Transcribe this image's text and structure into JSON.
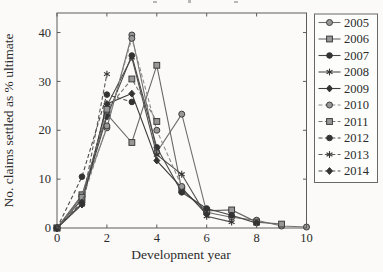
{
  "figure": {
    "xlabel": "Development year",
    "ylabel": "No. claims settled as % ultimate"
  },
  "colors": {
    "ink": "#2b2b2b",
    "paper": "#fbfaf8",
    "axis_frame": "#5c5c5c",
    "legend_border": "#686868",
    "marker_light_fill": "#989898",
    "marker_dark_fill": "#333333",
    "marker_stroke": "#3c3c3c"
  },
  "chart_data": {
    "type": "line",
    "title": "",
    "xlabel": "Development year",
    "ylabel": "No. claims settled as % ultimate",
    "xlim": [
      0,
      10
    ],
    "ylim": [
      0,
      44
    ],
    "x_ticks": [
      0,
      2,
      4,
      6,
      8,
      10
    ],
    "y_ticks": [
      0,
      10,
      20,
      30,
      40
    ],
    "grid": false,
    "legend_position": "outside-right-top",
    "series": [
      {
        "name": "2005",
        "line": "solid",
        "marker": "circle",
        "color": "#6f6f6f",
        "x": [
          0,
          1,
          2,
          3,
          4,
          5,
          6,
          7,
          8,
          9,
          10
        ],
        "values": [
          0,
          6.5,
          20.5,
          39.5,
          15.5,
          23.3,
          3.2,
          2.2,
          1.6,
          0.4,
          0.2
        ]
      },
      {
        "name": "2006",
        "line": "solid",
        "marker": "square",
        "color": "#686868",
        "x": [
          0,
          1,
          2,
          3,
          4,
          5,
          6,
          7,
          8,
          9
        ],
        "values": [
          0,
          6.8,
          23.3,
          17.5,
          33.3,
          7.8,
          3.5,
          3.7,
          1.2,
          0.8
        ]
      },
      {
        "name": "2007",
        "line": "solid",
        "marker": "filled-circle",
        "color": "#474747",
        "x": [
          0,
          1,
          2,
          3,
          4,
          5,
          6,
          7,
          8
        ],
        "values": [
          0,
          5.9,
          22.8,
          35.3,
          16.5,
          7.3,
          4.0,
          2.6,
          1.0
        ]
      },
      {
        "name": "2008",
        "line": "solid",
        "marker": "star",
        "color": "#4e4e4e",
        "x": [
          0,
          1,
          2,
          3,
          4,
          5,
          6,
          7
        ],
        "values": [
          0,
          5.0,
          25.0,
          34.9,
          15.0,
          11.0,
          2.4,
          1.2
        ]
      },
      {
        "name": "2009",
        "line": "solid",
        "marker": "diamond",
        "color": "#3d3d3d",
        "x": [
          0,
          1,
          2,
          3,
          4,
          5,
          6
        ],
        "values": [
          0,
          4.8,
          25.4,
          27.5,
          13.8,
          8.2,
          2.8
        ]
      },
      {
        "name": "2010",
        "line": "dashed",
        "marker": "circle",
        "color": "#8c8c8c",
        "x": [
          0,
          1,
          2,
          3,
          4,
          5
        ],
        "values": [
          0,
          5.5,
          20.9,
          38.8,
          20.0,
          8.5
        ]
      },
      {
        "name": "2011",
        "line": "dashed",
        "marker": "square",
        "color": "#737373",
        "x": [
          0,
          1,
          2,
          3,
          4
        ],
        "values": [
          0,
          6.3,
          24.3,
          30.5,
          21.8
        ]
      },
      {
        "name": "2012",
        "line": "dashed",
        "marker": "filled-circle",
        "color": "#4a4a4a",
        "x": [
          0,
          1,
          2,
          3
        ],
        "values": [
          0,
          10.5,
          27.3,
          25.8
        ]
      },
      {
        "name": "2013",
        "line": "dashed",
        "marker": "star",
        "color": "#5a5a5a",
        "x": [
          0,
          1,
          2
        ],
        "values": [
          0,
          4.8,
          31.5
        ]
      },
      {
        "name": "2014",
        "line": "dashed",
        "marker": "diamond",
        "color": "#525252",
        "x": [
          0,
          1
        ],
        "values": [
          0,
          5.2
        ]
      }
    ]
  }
}
